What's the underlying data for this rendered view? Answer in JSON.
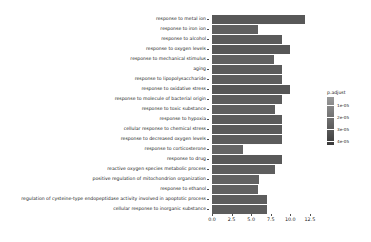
{
  "chart_data": {
    "type": "bar",
    "orientation": "horizontal",
    "title": "",
    "xlabel": "",
    "ylabel": "",
    "xlim": [
      0,
      12.9
    ],
    "xticks": [
      "0.0",
      "2.5",
      "5.0",
      "7.5",
      "10.0",
      "12.5"
    ],
    "xtickvalues": [
      0,
      2.5,
      5,
      7.5,
      10,
      12.5
    ],
    "grid": false,
    "categories": [
      "response to metal ion",
      "response to iron ion",
      "response to alcohol",
      "response to oxygen levels",
      "response to mechanical stimulus",
      "aging",
      "response to lipopolysaccharide",
      "response to oxidative stress",
      "response to molecule of bacterial origin",
      "response to toxic substance",
      "response to hypoxia",
      "cellular response to chemical stress",
      "response to decreased oxygen levels",
      "response to corticosterone",
      "response to drug",
      "reactive oxygen species metabolic process",
      "positive regulation of mitochondrion organization",
      "response to ethanol",
      "regulation of cysteine-type endopeptidase activity involved in apoptotic process",
      "cellular response to inorganic substance"
    ],
    "values": [
      11.9,
      5.9,
      9.0,
      10.0,
      7.9,
      9.0,
      9.0,
      10.0,
      9.0,
      8.0,
      9.0,
      9.0,
      9.0,
      4.0,
      9.0,
      8.0,
      6.0,
      5.9,
      7.0,
      7.0
    ],
    "bar_colors": [
      "#585858",
      "#5f5f5f",
      "#5a5a5a",
      "#575757",
      "#606060",
      "#5b5b5b",
      "#5d5d5d",
      "#565656",
      "#5c5c5c",
      "#5e5e5e",
      "#5b5b5b",
      "#5a5a5a",
      "#5c5c5c",
      "#656565",
      "#595959",
      "#5e5e5e",
      "#626262",
      "#616161",
      "#5d5d5d",
      "#5d5d5d"
    ],
    "legend": {
      "title": "p.adjust",
      "position": "right",
      "ticks": [
        "1e-05",
        "2e-05",
        "3e-05",
        "4e-05"
      ],
      "tick_values": [
        1e-05,
        2e-05,
        3e-05,
        4e-05
      ],
      "gradient_top_color": "#9a9a9a",
      "gradient_bottom_color": "#3a3a3a"
    }
  },
  "colors": {
    "axis": "#4d4d4d",
    "text": "#1a1a1a",
    "background": "#ffffff"
  }
}
